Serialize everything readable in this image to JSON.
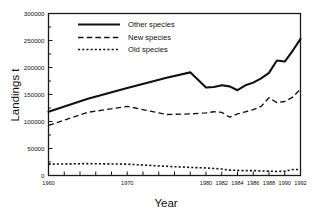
{
  "chart_data": {
    "type": "line",
    "title": "",
    "xlabel": "Year",
    "ylabel": "Landings t",
    "xlim": [
      1960,
      1992
    ],
    "ylim": [
      0,
      300000
    ],
    "grid": false,
    "legend_position": "top-left",
    "x": [
      1960,
      1970,
      1980,
      1981,
      1982,
      1983,
      1984,
      1985,
      1986,
      1987,
      1988,
      1989,
      1990,
      1991,
      1992
    ],
    "x_tick_labels": [
      "1960",
      "1970",
      "1980",
      "1982",
      "1984",
      "1986",
      "1988",
      "1990",
      "1992"
    ],
    "y_tick_labels": [
      "0",
      "50000",
      "100000",
      "150000",
      "200000",
      "250000",
      "300000"
    ],
    "y_ticks": [
      0,
      50000,
      100000,
      150000,
      200000,
      250000,
      300000
    ],
    "series": [
      {
        "name": "Other species",
        "style": "solid",
        "x": [
          1960,
          1965,
          1970,
          1975,
          1978,
          1980,
          1981,
          1982,
          1983,
          1984,
          1985,
          1986,
          1987,
          1988,
          1989,
          1990,
          1991,
          1992
        ],
        "values": [
          118000,
          142000,
          162000,
          181000,
          191000,
          163000,
          164000,
          167000,
          165000,
          158000,
          167000,
          172000,
          180000,
          190000,
          213000,
          211000,
          231000,
          253000
        ]
      },
      {
        "name": "New species",
        "style": "dashed",
        "x": [
          1960,
          1965,
          1970,
          1975,
          1978,
          1980,
          1981,
          1982,
          1983,
          1984,
          1985,
          1986,
          1987,
          1988,
          1989,
          1990,
          1991,
          1992
        ],
        "values": [
          93000,
          117000,
          128000,
          113000,
          114000,
          116000,
          118000,
          117000,
          108000,
          114000,
          118000,
          122000,
          128000,
          144000,
          135000,
          137000,
          145000,
          160000
        ]
      },
      {
        "name": "Old species",
        "style": "dotted",
        "x": [
          1960,
          1965,
          1970,
          1975,
          1978,
          1980,
          1981,
          1982,
          1983,
          1984,
          1985,
          1986,
          1987,
          1988,
          1989,
          1990,
          1991,
          1992
        ],
        "values": [
          21000,
          22000,
          21000,
          17000,
          15000,
          14000,
          13000,
          12000,
          10000,
          9500,
          9000,
          9000,
          8500,
          8000,
          7500,
          8000,
          11000,
          11000
        ]
      }
    ],
    "legend_entries": [
      {
        "label": "Other species",
        "style": "solid"
      },
      {
        "label": "New species",
        "style": "dashed"
      },
      {
        "label": "Old species",
        "style": "dotted"
      }
    ],
    "colors": {
      "axis": "#1a1a1a",
      "line": "#111111",
      "background": "#ffffff"
    }
  }
}
